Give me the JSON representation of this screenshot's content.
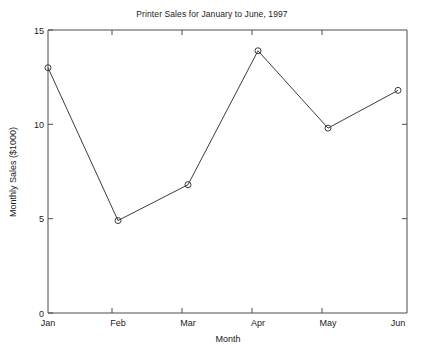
{
  "chart_data": {
    "type": "line",
    "title": "Printer Sales for January to June, 1997",
    "xlabel": "Month",
    "ylabel": "Monthly Sales ($1000)",
    "categories": [
      "Jan",
      "Feb",
      "Mar",
      "Apr",
      "May",
      "Jun"
    ],
    "values": [
      13.0,
      4.9,
      6.8,
      13.9,
      9.8,
      11.8
    ],
    "series": [
      {
        "name": "Monthly Sales",
        "values": [
          13.0,
          4.9,
          6.8,
          13.9,
          9.8,
          11.8
        ]
      }
    ],
    "ylim": [
      0,
      15
    ],
    "yticks": [
      0,
      5,
      10,
      15
    ],
    "ytick_labels": [
      "0",
      "5",
      "10",
      "15"
    ],
    "xtick_labels": [
      "Jan",
      "Feb",
      "Mar",
      "Apr",
      "May",
      "Jun"
    ],
    "grid": false,
    "legend": false,
    "legend_position": "none",
    "marker": "open-circle",
    "line_color": "#3c3c3c",
    "axis_color": "#4d4d4d",
    "background_color": "#ffffff"
  }
}
